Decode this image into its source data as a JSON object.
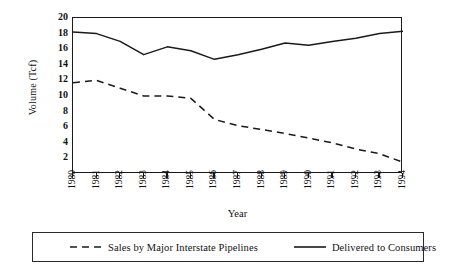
{
  "chart_data": {
    "type": "line",
    "title": "",
    "xlabel": "Year",
    "ylabel": "Volume (Tcf)",
    "x": [
      1980,
      1981,
      1982,
      1983,
      1984,
      1985,
      1986,
      1987,
      1988,
      1989,
      1990,
      1991,
      1992,
      1993,
      1994
    ],
    "categories": [
      "1980",
      "1981",
      "1982",
      "1983",
      "1984",
      "1985",
      "1986",
      "1987",
      "1988",
      "1989",
      "1990",
      "1991",
      "1992",
      "1993",
      "1994"
    ],
    "xlim": [
      1980,
      1994
    ],
    "ylim": [
      0,
      20
    ],
    "yticks": [
      2,
      4,
      6,
      8,
      10,
      12,
      14,
      16,
      18,
      20
    ],
    "ytick_labels": [
      "2",
      "4",
      "6",
      "8",
      "10",
      "12",
      "14",
      "16",
      "18",
      "20"
    ],
    "grid": false,
    "legend_position": "below-outside",
    "series": [
      {
        "name": "Sales by Major Interstate Pipelines",
        "style": "dashed",
        "color": "#1a1a1a",
        "values": [
          11.7,
          12.0,
          11.0,
          10.0,
          10.0,
          9.7,
          7.0,
          6.2,
          5.7,
          5.2,
          4.6,
          4.0,
          3.2,
          2.6,
          1.5
        ]
      },
      {
        "name": "Delivered to Consumers",
        "style": "solid",
        "color": "#1a1a1a",
        "values": [
          18.2,
          18.0,
          17.0,
          15.3,
          16.3,
          15.8,
          14.7,
          15.3,
          16.0,
          16.8,
          16.5,
          17.0,
          17.4,
          18.0,
          18.3
        ]
      }
    ]
  },
  "legend": {
    "entries": [
      {
        "label": "Sales by Major Interstate Pipelines",
        "style": "dashed"
      },
      {
        "label": "Delivered to Consumers",
        "style": "solid"
      }
    ]
  }
}
